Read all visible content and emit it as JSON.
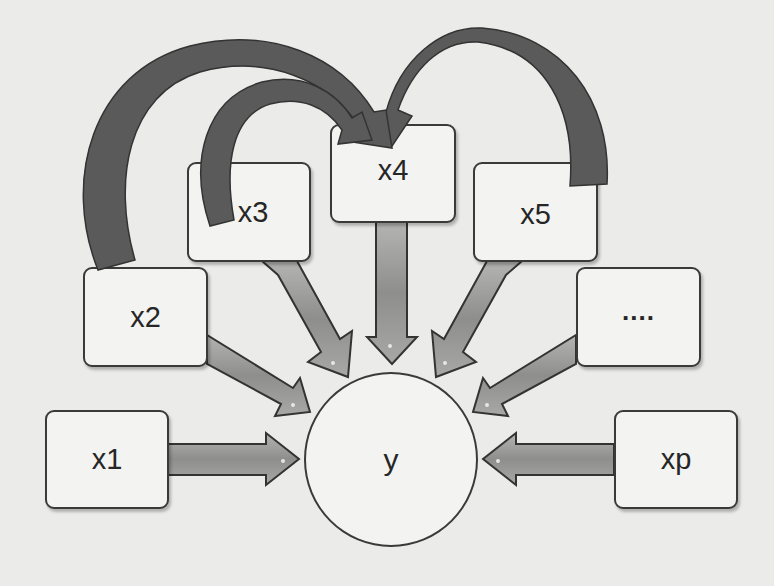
{
  "diagram": {
    "type": "regression-dependency-diagram",
    "target": {
      "id": "y",
      "label": "y"
    },
    "predictors": [
      {
        "id": "x1",
        "label": "x1"
      },
      {
        "id": "x2",
        "label": "x2"
      },
      {
        "id": "x3",
        "label": "x3"
      },
      {
        "id": "x4",
        "label": "x4"
      },
      {
        "id": "x5",
        "label": "x5"
      },
      {
        "id": "dots",
        "label": "...."
      },
      {
        "id": "xp",
        "label": "xp"
      }
    ],
    "edges": [
      {
        "from": "x1",
        "to": "y",
        "style": "straight"
      },
      {
        "from": "x2",
        "to": "y",
        "style": "straight"
      },
      {
        "from": "x3",
        "to": "y",
        "style": "straight"
      },
      {
        "from": "x4",
        "to": "y",
        "style": "straight"
      },
      {
        "from": "x5",
        "to": "y",
        "style": "straight"
      },
      {
        "from": "dots",
        "to": "y",
        "style": "straight"
      },
      {
        "from": "xp",
        "to": "y",
        "style": "straight"
      },
      {
        "from": "x2",
        "to": "x4",
        "style": "curved"
      },
      {
        "from": "x3",
        "to": "x4",
        "style": "curved"
      },
      {
        "from": "x5",
        "to": "x4",
        "style": "curved"
      }
    ],
    "colors": {
      "background": "#ebebe9",
      "node_fill": "#f3f3f1",
      "node_border": "#3a3a3a",
      "straight_arrow_fill": "#9a9a98",
      "curved_arrow_fill": "#5a5a5a"
    }
  }
}
